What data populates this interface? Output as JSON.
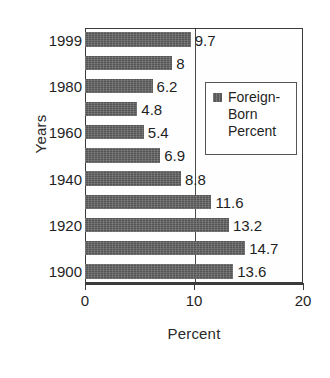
{
  "chart_data": {
    "type": "bar",
    "orientation": "horizontal",
    "title": "",
    "xlabel": "Percent",
    "ylabel": "Years",
    "xlim": [
      0,
      20
    ],
    "xticks": [
      0,
      10,
      20
    ],
    "xtick_labels": [
      "0",
      "10",
      "20"
    ],
    "grid": true,
    "gridlines_x": [
      10
    ],
    "legend_position": "inside-right",
    "legend": [
      "Foreign-\nBorn\nPercent"
    ],
    "series": [
      {
        "name": "Foreign-Born Percent",
        "color": "#5a5a5a",
        "values": [
          9.7,
          8,
          6.2,
          4.8,
          5.4,
          6.9,
          8.8,
          11.6,
          13.2,
          14.7,
          13.6
        ]
      }
    ],
    "categories": [
      "1999",
      "1990",
      "1980",
      "1970",
      "1960",
      "1950",
      "1940",
      "1930",
      "1920",
      "1910",
      "1900"
    ],
    "category_tick_labels_shown": [
      "1999",
      "",
      "1980",
      "",
      "1960",
      "",
      "1940",
      "",
      "1920",
      "",
      "1900"
    ],
    "data_labels": [
      "9.7",
      "8",
      "6.2",
      "4.8",
      "5.4",
      "6.9",
      "8.8",
      "11.6",
      "13.2",
      "14.7",
      "13.6"
    ]
  },
  "axes": {
    "y_title": "Years",
    "x_title": "Percent"
  },
  "legend": {
    "label": "Foreign-\nBorn\nPercent",
    "swatch_color": "#5a5a5a"
  },
  "colors": {
    "bar": "#5a5a5a",
    "frame": "#3b3b3b",
    "text": "#1f1f1f",
    "background": "#ffffff"
  }
}
